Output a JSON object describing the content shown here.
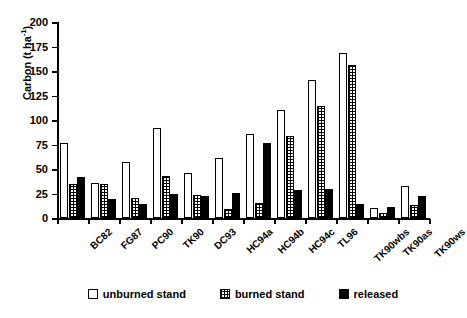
{
  "chart_data": {
    "type": "bar",
    "title": "",
    "xlabel": "",
    "ylabel": "Carbon (t ha-1)",
    "ylabel_main": "Carbon (t ha",
    "ylabel_sup": "-1",
    "ylabel_close": ")",
    "ylim": [
      0,
      200
    ],
    "yticks": [
      0,
      25,
      50,
      75,
      100,
      125,
      150,
      175,
      200
    ],
    "grid": false,
    "legend_position": "bottom",
    "categories": [
      "BC82",
      "FG87",
      "PC90",
      "TK90",
      "DC93",
      "HC94a",
      "HC94b",
      "HC94c",
      "TL96",
      "TK90wbs",
      "TK90as",
      "TK90ws"
    ],
    "series": [
      {
        "name": "unburned stand",
        "fill": "open-white",
        "values": [
          77,
          36,
          57,
          92,
          46,
          61,
          86,
          110,
          141,
          168,
          10,
          33
        ]
      },
      {
        "name": "burned stand",
        "fill": "cross-hatch",
        "values": [
          35,
          35,
          20,
          43,
          23,
          9,
          15,
          84,
          114,
          156,
          5,
          13
        ]
      },
      {
        "name": "released",
        "fill": "solid-black",
        "values": [
          42,
          19,
          14,
          24,
          22,
          26,
          77,
          29,
          30,
          14,
          11,
          22
        ]
      }
    ]
  },
  "legend": {
    "items": [
      {
        "label": "unburned stand",
        "swatch": "open-white"
      },
      {
        "label": "burned stand",
        "swatch": "cross-hatch"
      },
      {
        "label": "released",
        "swatch": "solid-black"
      }
    ]
  }
}
